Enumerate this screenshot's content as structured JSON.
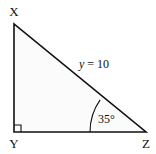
{
  "diagram": {
    "type": "right-triangle",
    "vertices": {
      "top": "X",
      "right_angle": "Y",
      "acute": "Z"
    },
    "hypotenuse_label": "y = 10",
    "hypotenuse_variable": "y",
    "hypotenuse_value": 10,
    "angle_label": "35°",
    "angle_degrees": 35,
    "angle_at": "Z",
    "right_angle_at": "Y",
    "colors": {
      "stroke": "#111111",
      "fill": "#fbfbfb",
      "background": "#ffffff"
    }
  }
}
